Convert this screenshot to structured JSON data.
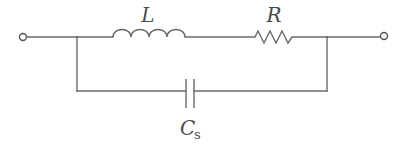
{
  "diagram": {
    "type": "circuit-schematic",
    "components": [
      {
        "id": "inductor",
        "symbol": "L",
        "label": "L",
        "kind": "inductor"
      },
      {
        "id": "resistor",
        "symbol": "R",
        "label": "R",
        "kind": "resistor"
      },
      {
        "id": "capacitor",
        "symbol": "C",
        "subscript": "s",
        "label": "Cs",
        "kind": "capacitor"
      }
    ],
    "terminals": [
      {
        "id": "left-terminal"
      },
      {
        "id": "right-terminal"
      }
    ],
    "labels": {
      "inductor": "L",
      "resistor": "R",
      "capacitor_main": "C",
      "capacitor_sub": "s"
    },
    "colors": {
      "line": "#6a6a6a",
      "text": "#4a4a4a",
      "background": "#ffffff"
    }
  }
}
